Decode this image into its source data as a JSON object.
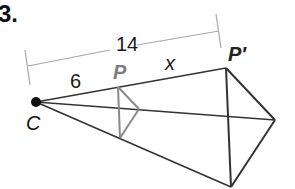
{
  "exercise": {
    "number": "3."
  },
  "diagram": {
    "labels": {
      "center": "C",
      "preimage_vertex": "P",
      "image_vertex": "P′",
      "full_length": "14",
      "partial_length": "6",
      "unknown_length": "x"
    },
    "colors": {
      "image_lines": "#333333",
      "preimage_lines": "#8a8a8a",
      "dimension_lines": "#a8a8a8",
      "preimage_label": "#7d7d7d",
      "text": "#1a1a1a"
    },
    "points": {
      "C": [
        36,
        102
      ],
      "P": [
        118,
        87
      ],
      "P_right": [
        139,
        109
      ],
      "P_bottom": [
        120,
        138
      ],
      "P_prime": [
        226,
        68
      ],
      "P_prime_right": [
        275,
        120
      ],
      "P_prime_bottom": [
        231,
        187
      ]
    }
  }
}
